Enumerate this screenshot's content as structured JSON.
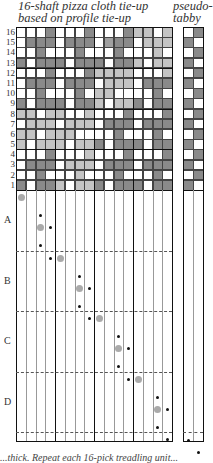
{
  "title": {
    "main": "16-shaft pizza cloth tie-up\nbased on profile tie-up",
    "pseudo": "pseudo-\ntabby"
  },
  "row_labels": [
    "16",
    "15",
    "14",
    "13",
    "12",
    "11",
    "10",
    "9",
    "8",
    "7",
    "6",
    "5",
    "4",
    "3",
    "2",
    "1"
  ],
  "section_labels": [
    "A",
    "B",
    "C",
    "D"
  ],
  "colors": {
    "white": "#ffffff",
    "dark": "#8a8a8a",
    "light": "#c4c4c4",
    "grid_line": "#444444",
    "thick_line": "#111111",
    "green_dot": "#aaaaaa",
    "black_dot": "#111111"
  },
  "tieup_rows_top_to_bottom": [
    "WWWDWWWDWWWDLLWL",
    "WDDDWDDDWMDDWLLL",
    "WWDWWWDWWWDWWWLW",
    "DWDDDWDDDWDDLWLL",
    "WWWDWWWDLLLLWWWL",
    "WDDDWDDDWLLLWDDD",
    "WWDWWWDWLLWWWWDW",
    "DWDDDWDDLWLLDWDD",
    "LLWLLWWLWWWDWWWD",
    "WLLLWLLLWDDDWDDD",
    "LLWLLLWWWWDWWWDW",
    "LWLLLWLLDWDDDWDD",
    "WWWDWWWLWWWDWWWD",
    "WDDDWLLLWDDDWDDD",
    "WWDWWWLWWWDWWWDW",
    "DWDDLWLLDWDDDWDD"
  ],
  "pseudo_tabby_rows_top_to_bottom": [
    "WD",
    "DW",
    "WD",
    "DW",
    "WD",
    "DW",
    "WD",
    "DW",
    "WD",
    "DW",
    "WD",
    "DW",
    "WD",
    "DW",
    "WD",
    "DW"
  ],
  "treadling": {
    "green_dots": [
      [
        0,
        0
      ],
      [
        2,
        1
      ],
      [
        4,
        2
      ],
      [
        6,
        3
      ],
      [
        8,
        4
      ],
      [
        10,
        5
      ],
      [
        12,
        6
      ],
      [
        14,
        7
      ]
    ],
    "black_dots": [
      [
        2,
        0.6
      ],
      [
        3,
        1
      ],
      [
        2,
        1.6
      ],
      [
        3,
        2
      ],
      [
        6,
        2.6
      ],
      [
        7,
        3
      ],
      [
        6,
        3.6
      ],
      [
        7,
        4
      ],
      [
        10,
        4.6
      ],
      [
        11,
        5
      ],
      [
        10,
        5.6
      ],
      [
        11,
        6
      ],
      [
        14,
        6.6
      ],
      [
        15,
        7
      ],
      [
        14,
        7.6
      ],
      [
        15,
        8
      ]
    ],
    "pseudo_dots": [
      [
        0,
        8.4
      ],
      [
        1,
        8.8
      ]
    ]
  },
  "caption": "...thick.  Repeat each 16-pick treadling unit..."
}
